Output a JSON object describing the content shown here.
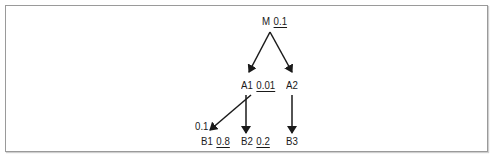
{
  "diagram": {
    "type": "tree",
    "nodes": [
      {
        "id": "M",
        "label": "M",
        "value": "0.1"
      },
      {
        "id": "A1",
        "label": "A1",
        "value": "0.01"
      },
      {
        "id": "A2",
        "label": "A2",
        "value": ""
      },
      {
        "id": "B1",
        "label": "B1",
        "value": "0.8"
      },
      {
        "id": "B2",
        "label": "B2",
        "value": "0.2"
      },
      {
        "id": "B3",
        "label": "B3",
        "value": ""
      }
    ],
    "edges": [
      {
        "from": "M",
        "to": "A1"
      },
      {
        "from": "M",
        "to": "A2"
      },
      {
        "from": "A1",
        "to": "B1",
        "label": "0.1"
      },
      {
        "from": "A1",
        "to": "B2"
      },
      {
        "from": "A2",
        "to": "B3"
      }
    ],
    "edge_label_b1": "0.1"
  },
  "colors": {
    "line": "#1a1a1a",
    "border": "#9a9a9a"
  }
}
